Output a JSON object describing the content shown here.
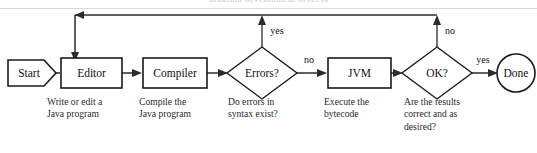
{
  "figure": {
    "clipped_caption_fragment": "program development process",
    "colors": {
      "background": "#ffffff",
      "stroke": "#1a1a1a",
      "connector": "#2b2b2b",
      "text": "#111111",
      "caption_text": "#2a2a2a",
      "rule": "#d8d8d8"
    }
  },
  "nodes": [
    {
      "id": "start",
      "label": "Start",
      "shape": "pentagon-arrow",
      "caption": ""
    },
    {
      "id": "editor",
      "label": "Editor",
      "shape": "rectangle",
      "caption": "Write or edit a\nJava program"
    },
    {
      "id": "compiler",
      "label": "Compiler",
      "shape": "rectangle",
      "caption": "Compile the\nJava program"
    },
    {
      "id": "errors",
      "label": "Errors?",
      "shape": "diamond",
      "caption": "Do errors in\nsyntax exist?"
    },
    {
      "id": "jvm",
      "label": "JVM",
      "shape": "rectangle",
      "caption": "Execute the\nbytecode"
    },
    {
      "id": "ok",
      "label": "OK?",
      "shape": "diamond",
      "caption": "Are the results\ncorrect and as\ndesired?"
    },
    {
      "id": "done",
      "label": "Done",
      "shape": "circle",
      "caption": ""
    }
  ],
  "edges": [
    {
      "id": "start-editor",
      "from": "start",
      "to": "editor",
      "label": ""
    },
    {
      "id": "editor-compiler",
      "from": "editor",
      "to": "compiler",
      "label": ""
    },
    {
      "id": "compiler-errors",
      "from": "compiler",
      "to": "errors",
      "label": ""
    },
    {
      "id": "errors-yes",
      "from": "errors",
      "to": "editor",
      "label": "yes"
    },
    {
      "id": "errors-no",
      "from": "errors",
      "to": "jvm",
      "label": "no"
    },
    {
      "id": "jvm-ok",
      "from": "jvm",
      "to": "ok",
      "label": ""
    },
    {
      "id": "ok-no",
      "from": "ok",
      "to": "editor",
      "label": "no"
    },
    {
      "id": "ok-yes",
      "from": "ok",
      "to": "done",
      "label": "yes"
    }
  ],
  "labels": {
    "start": "Start",
    "editor": "Editor",
    "compiler": "Compiler",
    "errors": "Errors?",
    "jvm": "JVM",
    "ok": "OK?",
    "done": "Done",
    "errors_yes": "yes",
    "errors_no": "no",
    "ok_no": "no",
    "ok_yes": "yes"
  },
  "captions": {
    "editor": "Write or edit a\nJava program",
    "compiler": "Compile the\nJava program",
    "errors": "Do errors in\nsyntax exist?",
    "jvm": "Execute the\nbytecode",
    "ok": "Are the results\ncorrect and as\ndesired?"
  }
}
